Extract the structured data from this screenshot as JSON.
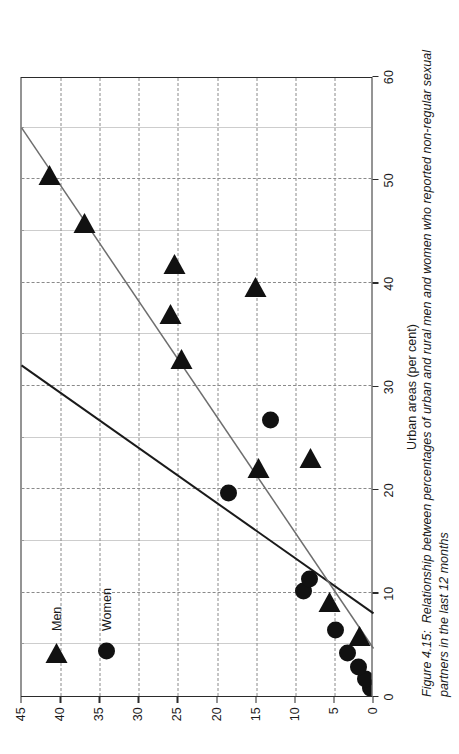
{
  "figure": {
    "caption_number": "Figure 4.15:",
    "caption_text": "Relationship between percentages of urban and rural men and women who reported non-regular sexual partners in the last 12 months"
  },
  "legend": {
    "position": "top-left-inside-plot",
    "items": [
      {
        "label": "Men",
        "marker": "triangle-right-icon",
        "color": "#111111"
      },
      {
        "label": "Women",
        "marker": "filled-circle-icon",
        "color": "#111111"
      }
    ]
  },
  "chart_data": {
    "type": "scatter",
    "title": "",
    "xlabel": "Urban areas (per cent)",
    "ylabel": "Rural areas (per cent)",
    "xlim": [
      0,
      60
    ],
    "ylim": [
      0,
      45
    ],
    "xticks": [
      0,
      10,
      20,
      30,
      40,
      50,
      60
    ],
    "yticks": [
      0,
      5,
      10,
      15,
      20,
      25,
      30,
      35,
      40,
      45
    ],
    "xticklabels": [
      "0",
      "10",
      "20",
      "30",
      "40",
      "50",
      "60"
    ],
    "yticklabels": [
      "0",
      "5",
      "10",
      "15",
      "20",
      "25",
      "30",
      "35",
      "40",
      "45"
    ],
    "minor_x_step": 5,
    "minor_y_step": 5,
    "grid": true,
    "grid_style": "dotted",
    "legend_position": "upper left",
    "series": [
      {
        "name": "Men",
        "marker": "triangle-right-icon",
        "color": "#111111",
        "points": [
          [
            6.0,
            1.8
          ],
          [
            9.3,
            5.6
          ],
          [
            23.2,
            8.0
          ],
          [
            22.3,
            14.7
          ],
          [
            32.8,
            24.5
          ],
          [
            37.2,
            26.0
          ],
          [
            39.8,
            15.1
          ],
          [
            42.0,
            25.5
          ],
          [
            46.0,
            37.0
          ],
          [
            50.6,
            41.4
          ]
        ]
      },
      {
        "name": "Women",
        "marker": "filled-circle-icon",
        "color": "#111111",
        "points": [
          [
            0.8,
            0.4
          ],
          [
            1.6,
            1.0
          ],
          [
            2.8,
            1.9
          ],
          [
            4.2,
            3.3
          ],
          [
            6.4,
            4.8
          ],
          [
            10.2,
            9.0
          ],
          [
            11.3,
            8.2
          ],
          [
            19.6,
            18.5
          ],
          [
            26.7,
            13.2
          ]
        ]
      }
    ],
    "trendlines": [
      {
        "name": "men-trendline",
        "color": "#1a1a1a",
        "width": 2.0,
        "x0": 8.0,
        "y0": 0.0,
        "x1": 32.0,
        "y1": 45.0
      },
      {
        "name": "women-trendline",
        "color": "#6e6e6e",
        "width": 1.5,
        "x0": 4.6,
        "y0": 0.0,
        "x1": 55.0,
        "y1": 45.0
      }
    ]
  }
}
